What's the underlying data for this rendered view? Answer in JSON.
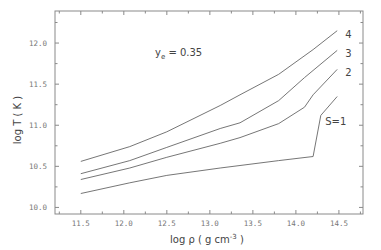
{
  "chart_data": {
    "type": "line",
    "title": "",
    "xlabel": "log ρ ( g cm⁻³ )",
    "xlabel_base": "log ρ ( g cm",
    "xlabel_exp": "-3",
    "xlabel_close": " )",
    "ylabel": "log T ( K )",
    "xlim": [
      11.2,
      14.78
    ],
    "ylim": [
      9.92,
      12.39
    ],
    "x_ticks": [
      "11.5",
      "12.0",
      "12.5",
      "13.0",
      "13.5",
      "14.0",
      "14.5"
    ],
    "y_ticks": [
      "10.0",
      "10.5",
      "11.0",
      "11.5",
      "12.0"
    ],
    "grid": false,
    "legend": "inline curve labels",
    "annotation": {
      "text": "y",
      "sub": "e",
      "rest": " = 0.35"
    },
    "series": [
      {
        "name": "4",
        "label": "4",
        "x": [
          11.5,
          12.07,
          12.5,
          13.12,
          13.35,
          13.8,
          14.2,
          14.48
        ],
        "y": [
          10.56,
          10.74,
          10.92,
          11.24,
          11.37,
          11.62,
          11.92,
          12.15
        ]
      },
      {
        "name": "3",
        "label": "3",
        "x": [
          11.5,
          12.07,
          12.5,
          13.12,
          13.35,
          13.8,
          14.1,
          14.48
        ],
        "y": [
          10.41,
          10.57,
          10.73,
          10.96,
          11.03,
          11.3,
          11.58,
          11.91
        ]
      },
      {
        "name": "2",
        "label": "2",
        "x": [
          11.5,
          12.07,
          12.5,
          13.12,
          13.35,
          13.8,
          14.1,
          14.2,
          14.48
        ],
        "y": [
          10.34,
          10.48,
          10.61,
          10.78,
          10.85,
          11.02,
          11.22,
          11.37,
          11.68
        ]
      },
      {
        "name": "S=1",
        "label": "S=1",
        "x": [
          11.5,
          12.07,
          12.5,
          13.12,
          13.35,
          13.8,
          14.2,
          14.29,
          14.48
        ],
        "y": [
          10.17,
          10.3,
          10.39,
          10.48,
          10.51,
          10.57,
          10.62,
          11.12,
          11.35
        ]
      }
    ],
    "axis_color": "#777777",
    "line_color": "#666666"
  }
}
